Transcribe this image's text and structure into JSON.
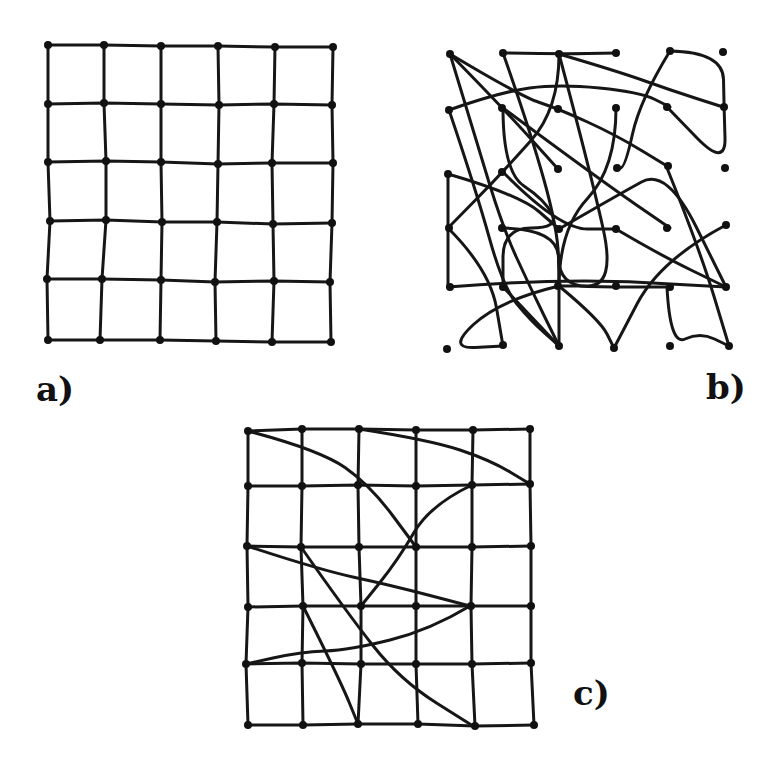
{
  "figure": {
    "ink_color": "#161616",
    "background": "#ffffff",
    "panels": [
      {
        "id": "a",
        "label": "a)",
        "label_pos": [
          36,
          372
        ],
        "description": "Regular 6x6 node grid, 5x5 cells, hand-drawn",
        "columns_x": [
          [
            48,
            104,
            161,
            218,
            275,
            333
          ],
          [
            48,
            104,
            161,
            219,
            274,
            332
          ],
          [
            48,
            106,
            161,
            218,
            272,
            333
          ],
          [
            50,
            106,
            162,
            217,
            273,
            332
          ],
          [
            47,
            102,
            161,
            215,
            274,
            330
          ],
          [
            48,
            100,
            160,
            216,
            272,
            331
          ]
        ],
        "rows_y": [
          [
            45,
            45,
            46,
            46,
            47,
            47
          ],
          [
            104,
            103,
            104,
            105,
            104,
            105
          ],
          [
            162,
            161,
            162,
            164,
            163,
            163
          ],
          [
            221,
            220,
            222,
            222,
            224,
            223
          ],
          [
            279,
            279,
            280,
            282,
            281,
            282
          ],
          [
            340,
            340,
            340,
            341,
            342,
            342
          ]
        ]
      },
      {
        "id": "b",
        "label": "b)",
        "label_pos": [
          706,
          370
        ],
        "description": "Same 36 nodes connected in a scrambled / tangled arrangement",
        "paths": [
          [
            [
              450,
              54
            ],
            [
              503,
              108
            ],
            [
              558,
              169
            ]
          ],
          [
            [
              450,
              54
            ],
            [
              476,
              140
            ],
            [
              503,
              228
            ],
            [
              530,
              287
            ],
            [
              559,
              346
            ]
          ],
          [
            [
              450,
              54
            ],
            [
              520,
              96
            ],
            [
              559,
              109
            ],
            [
              616,
              135
            ],
            [
              667,
              166
            ]
          ],
          [
            [
              503,
              53
            ],
            [
              559,
              54
            ],
            [
              616,
              53
            ]
          ],
          [
            [
              503,
              53
            ],
            [
              530,
              130
            ],
            [
              558,
              230
            ],
            [
              559,
              286
            ]
          ],
          [
            [
              559,
              54
            ],
            [
              559,
              109
            ],
            [
              503,
              172
            ],
            [
              448,
              228
            ]
          ],
          [
            [
              559,
              54
            ],
            [
              620,
              72
            ],
            [
              670,
              90
            ],
            [
              723,
              107
            ]
          ],
          [
            [
              559,
              54
            ],
            [
              590,
              170
            ],
            [
              616,
              286
            ],
            [
              559,
              286
            ]
          ],
          [
            [
              670,
              51
            ],
            [
              723,
              52
            ],
            [
              724,
              107
            ],
            [
              726,
              168
            ],
            [
              667,
              107
            ]
          ],
          [
            [
              670,
              51
            ],
            [
              640,
              100
            ],
            [
              625,
              168
            ],
            [
              616,
              168
            ]
          ],
          [
            [
              449,
              110
            ],
            [
              500,
              92
            ],
            [
              559,
              84
            ],
            [
              640,
              92
            ],
            [
              670,
              107
            ]
          ],
          [
            [
              449,
              110
            ],
            [
              476,
              190
            ],
            [
              503,
              287
            ],
            [
              530,
              320
            ],
            [
              559,
              346
            ]
          ],
          [
            [
              503,
              108
            ],
            [
              503,
              172
            ],
            [
              545,
              200
            ],
            [
              559,
              228
            ],
            [
              503,
              228
            ],
            [
              503,
              287
            ]
          ],
          [
            [
              503,
              108
            ],
            [
              600,
              180
            ],
            [
              670,
              228
            ]
          ],
          [
            [
              448,
              174
            ],
            [
              448,
              228
            ],
            [
              448,
              287
            ]
          ],
          [
            [
              448,
              174
            ],
            [
              520,
              195
            ],
            [
              559,
              229
            ]
          ],
          [
            [
              503,
              172
            ],
            [
              559,
              229
            ],
            [
              616,
              229
            ]
          ],
          [
            [
              559,
              229
            ],
            [
              616,
              196
            ],
            [
              667,
              168
            ],
            [
              726,
              287
            ]
          ],
          [
            [
              448,
              228
            ],
            [
              490,
              270
            ],
            [
              503,
              346
            ]
          ],
          [
            [
              503,
              228
            ],
            [
              558,
              229
            ],
            [
              559,
              286
            ],
            [
              616,
              287
            ],
            [
              667,
              287
            ]
          ],
          [
            [
              616,
              229
            ],
            [
              660,
              255
            ],
            [
              726,
              287
            ]
          ],
          [
            [
              448,
              287
            ],
            [
              560,
              278
            ],
            [
              726,
              287
            ]
          ],
          [
            [
              559,
              286
            ],
            [
              500,
              300
            ],
            [
              447,
              349
            ],
            [
              503,
              346
            ]
          ],
          [
            [
              559,
              286
            ],
            [
              600,
              320
            ],
            [
              614,
              348
            ]
          ],
          [
            [
              503,
              287
            ],
            [
              559,
              346
            ]
          ],
          [
            [
              726,
              225
            ],
            [
              660,
              260
            ],
            [
              614,
              348
            ]
          ],
          [
            [
              667,
              287
            ],
            [
              670,
              346
            ],
            [
              700,
              332
            ],
            [
              729,
              346
            ]
          ],
          [
            [
              667,
              168
            ],
            [
              700,
              250
            ],
            [
              729,
              346
            ]
          ],
          [
            [
              616,
              108
            ],
            [
              616,
              168
            ],
            [
              559,
              229
            ],
            [
              559,
              346
            ]
          ]
        ],
        "nodes": [
          [
            450,
            54
          ],
          [
            503,
            53
          ],
          [
            559,
            54
          ],
          [
            616,
            53
          ],
          [
            670,
            51
          ],
          [
            723,
            52
          ],
          [
            449,
            110
          ],
          [
            502,
            108
          ],
          [
            558,
            109
          ],
          [
            616,
            108
          ],
          [
            667,
            107
          ],
          [
            724,
            107
          ],
          [
            448,
            174
          ],
          [
            502,
            172
          ],
          [
            558,
            169
          ],
          [
            617,
            168
          ],
          [
            668,
            166
          ],
          [
            725,
            168
          ],
          [
            449,
            228
          ],
          [
            502,
            228
          ],
          [
            559,
            229
          ],
          [
            616,
            229
          ],
          [
            667,
            228
          ],
          [
            726,
            225
          ],
          [
            450,
            287
          ],
          [
            503,
            287
          ],
          [
            558,
            286
          ],
          [
            616,
            286
          ],
          [
            670,
            287
          ],
          [
            726,
            287
          ],
          [
            447,
            349
          ],
          [
            503,
            345
          ],
          [
            559,
            346
          ],
          [
            614,
            348
          ],
          [
            670,
            346
          ],
          [
            729,
            346
          ]
        ]
      },
      {
        "id": "c",
        "label": "c)",
        "label_pos": [
          573,
          676
        ],
        "description": "Regular 6x6 grid with several long-range crossing curves added",
        "columns_x": [
          [
            248,
            302,
            359,
            416,
            473,
            530
          ],
          [
            248,
            302,
            358,
            416,
            472,
            530
          ],
          [
            247,
            301,
            359,
            416,
            472,
            531
          ],
          [
            248,
            303,
            361,
            416,
            471,
            531
          ],
          [
            246,
            302,
            361,
            416,
            472,
            531
          ],
          [
            248,
            303,
            358,
            418,
            475,
            534
          ]
        ],
        "rows_y": [
          [
            431,
            429,
            429,
            430,
            430,
            429
          ],
          [
            486,
            486,
            485,
            486,
            485,
            484
          ],
          [
            546,
            547,
            547,
            547,
            547,
            546
          ],
          [
            607,
            606,
            606,
            606,
            606,
            606
          ],
          [
            664,
            663,
            664,
            664,
            664,
            663
          ],
          [
            725,
            725,
            724,
            724,
            726,
            725
          ]
        ],
        "extra_curves": [
          [
            [
              248,
              431
            ],
            [
              320,
              450
            ],
            [
              370,
              485
            ],
            [
              416,
              547
            ]
          ],
          [
            [
              359,
              429
            ],
            [
              430,
              440
            ],
            [
              490,
              460
            ],
            [
              530,
              484
            ]
          ],
          [
            [
              472,
              485
            ],
            [
              430,
              505
            ],
            [
              398,
              560
            ],
            [
              361,
              606
            ]
          ],
          [
            [
              247,
              546
            ],
            [
              320,
              570
            ],
            [
              390,
              585
            ],
            [
              470,
              606
            ]
          ],
          [
            [
              470,
              606
            ],
            [
              430,
              630
            ],
            [
              350,
              650
            ],
            [
              300,
              652
            ],
            [
              246,
              664
            ]
          ],
          [
            [
              301,
              547
            ],
            [
              345,
              610
            ],
            [
              400,
              680
            ],
            [
              473,
              726
            ]
          ],
          [
            [
              303,
              606
            ],
            [
              340,
              680
            ],
            [
              358,
              724
            ]
          ]
        ]
      }
    ]
  }
}
